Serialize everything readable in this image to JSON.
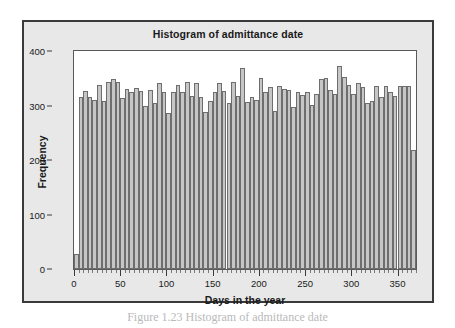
{
  "figure": {
    "caption": "Figure 1.23   Histogram of admittance date"
  },
  "chart_data": {
    "type": "bar",
    "title": "Histogram of admittance date",
    "xlabel": "Days in the year",
    "ylabel": "Frequency",
    "xlim": [
      0,
      370
    ],
    "ylim": [
      0,
      400
    ],
    "xticks": [
      0,
      50,
      100,
      150,
      200,
      250,
      300,
      350
    ],
    "xtick_labels": [
      "0",
      "50",
      "100",
      "150",
      "200",
      "250",
      "300",
      "350"
    ],
    "yticks": [
      0,
      100,
      200,
      300,
      400
    ],
    "ytick_labels": [
      "0",
      "100",
      "200",
      "300",
      "400"
    ],
    "minor_xtick_step": 5,
    "grid": false,
    "legend": false,
    "bin_width": 5,
    "bar_fill": "#c6c6c6",
    "bar_edge": "#6e6e6e",
    "bin_starts": [
      0,
      5,
      10,
      15,
      20,
      25,
      30,
      35,
      40,
      45,
      50,
      55,
      60,
      65,
      70,
      75,
      80,
      85,
      90,
      95,
      100,
      105,
      110,
      115,
      120,
      125,
      130,
      135,
      140,
      145,
      150,
      155,
      160,
      165,
      170,
      175,
      180,
      185,
      190,
      195,
      200,
      205,
      210,
      215,
      220,
      225,
      230,
      235,
      240,
      245,
      250,
      255,
      260,
      265,
      270,
      275,
      280,
      285,
      290,
      295,
      300,
      305,
      310,
      315,
      320,
      325,
      330,
      335,
      340,
      345,
      350,
      355,
      360,
      365
    ],
    "categories": [
      "0-5",
      "5-10",
      "10-15",
      "15-20",
      "20-25",
      "25-30",
      "30-35",
      "35-40",
      "40-45",
      "45-50",
      "50-55",
      "55-60",
      "60-65",
      "65-70",
      "70-75",
      "75-80",
      "80-85",
      "85-90",
      "90-95",
      "95-100",
      "100-105",
      "105-110",
      "110-115",
      "115-120",
      "120-125",
      "125-130",
      "130-135",
      "135-140",
      "140-145",
      "145-150",
      "150-155",
      "155-160",
      "160-165",
      "165-170",
      "170-175",
      "175-180",
      "180-185",
      "185-190",
      "190-195",
      "195-200",
      "200-205",
      "205-210",
      "210-215",
      "215-220",
      "220-225",
      "225-230",
      "230-235",
      "235-240",
      "240-245",
      "245-250",
      "250-255",
      "255-260",
      "260-265",
      "265-270",
      "270-275",
      "275-280",
      "280-285",
      "285-290",
      "290-295",
      "295-300",
      "300-305",
      "305-310",
      "310-315",
      "315-320",
      "320-325",
      "325-330",
      "330-335",
      "335-340",
      "340-345",
      "345-350",
      "350-355",
      "355-360",
      "360-365",
      "365-370"
    ],
    "values": [
      28,
      316,
      326,
      316,
      311,
      338,
      309,
      344,
      348,
      343,
      313,
      330,
      325,
      332,
      327,
      300,
      329,
      304,
      341,
      325,
      287,
      325,
      337,
      324,
      343,
      318,
      341,
      315,
      288,
      309,
      325,
      341,
      326,
      305,
      343,
      318,
      368,
      306,
      316,
      311,
      350,
      324,
      334,
      290,
      335,
      331,
      328,
      297,
      325,
      319,
      324,
      301,
      322,
      348,
      350,
      329,
      321,
      372,
      353,
      338,
      321,
      341,
      334,
      305,
      309,
      335,
      316,
      335,
      325,
      318,
      336,
      336,
      336,
      218
    ]
  }
}
